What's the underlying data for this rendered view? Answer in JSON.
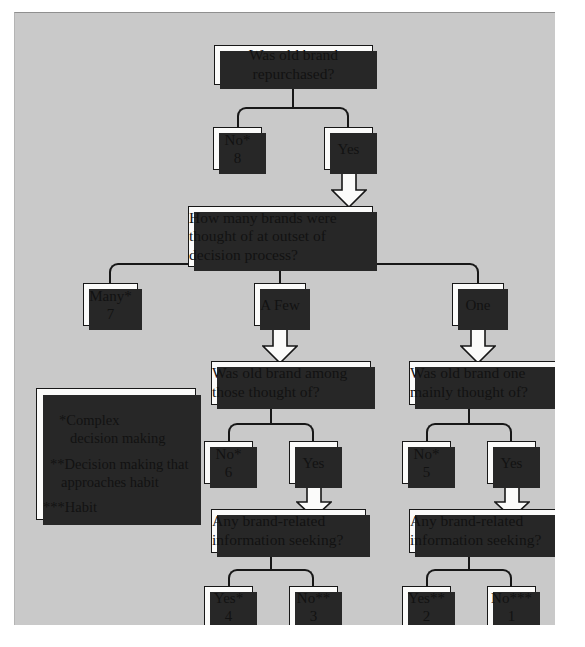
{
  "diagram": {
    "background_color": "#c9c9c9",
    "box_fill_color": "#fbfbfa",
    "line_color": "#171717",
    "shadow_color": "#272727"
  },
  "nodes": {
    "q_repurchased": {
      "text": "Was old brand repurchased?"
    },
    "a_no8": {
      "label": "No*",
      "number": "8"
    },
    "a_yes_top": {
      "label": "Yes"
    },
    "q_howmany": {
      "line1": "How many brands were",
      "line2": "thought of at outset of",
      "line3": "decision process?"
    },
    "a_many7": {
      "label": "Many*",
      "number": "7"
    },
    "a_afew": {
      "label": "A Few"
    },
    "a_one": {
      "label": "One"
    },
    "q_among": {
      "line1": "Was old brand among",
      "line2": "those thought of?"
    },
    "q_mainly": {
      "line1": "Was old brand one",
      "line2": "mainly thought of?"
    },
    "a_no6": {
      "label": "No*",
      "number": "6"
    },
    "a_yes_mid_left": {
      "label": "Yes"
    },
    "a_no5": {
      "label": "No*",
      "number": "5"
    },
    "a_yes_mid_right": {
      "label": "Yes"
    },
    "q_seeking_left": {
      "line1": "Any brand-related",
      "line2": "information seeking?"
    },
    "q_seeking_right": {
      "line1": "Any brand-related",
      "line2": "information seeking?"
    },
    "a_yes4": {
      "label": "Yes*",
      "number": "4"
    },
    "a_no3": {
      "label": "No**",
      "number": "3"
    },
    "a_yes2": {
      "label": "Yes**",
      "number": "2"
    },
    "a_no1": {
      "label": "No***",
      "number": "1"
    }
  },
  "legend": {
    "item1_line1": "*Complex",
    "item1_line2": "decision making",
    "item2_line1": "**Decision making that",
    "item2_line2": "approaches habit",
    "item3_line1": "***Habit"
  }
}
